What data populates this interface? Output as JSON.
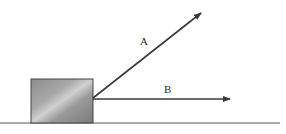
{
  "diagram": {
    "type": "force-diagram",
    "block": {
      "x": 31,
      "y": 79,
      "width": 62,
      "height": 44
    },
    "ground": {
      "y": 123,
      "x1": 0,
      "x2": 280
    },
    "origin": {
      "x": 93,
      "y": 98
    },
    "vectors": [
      {
        "label": "A",
        "tip": {
          "x": 202,
          "y": 12
        },
        "label_pos": {
          "x": 143,
          "y": 45
        }
      },
      {
        "label": "B",
        "tip": {
          "x": 231,
          "y": 100
        },
        "label_pos": {
          "x": 165,
          "y": 93
        }
      }
    ],
    "colors": {
      "line": "#3a3a3a",
      "block_dark": "#7a7a7a",
      "block_light": "#c8c8c8"
    }
  }
}
